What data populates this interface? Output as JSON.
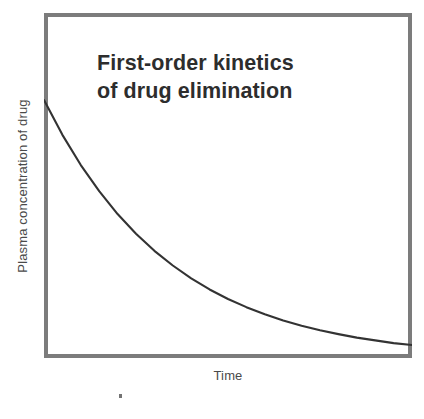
{
  "figure": {
    "width": 424,
    "height": 419,
    "background": "#ffffff"
  },
  "title_line_1": "First-order kinetics",
  "title_line_2": "of drug elimination",
  "title_full": "First-order kinetics\nof drug elimination",
  "axis": {
    "y_label": "Plasma concentration of drug",
    "x_label": "Time"
  },
  "colors": {
    "frame": "#7c7c7c",
    "curve": "#333333",
    "title_text": "#2d2d2d",
    "axis_text": "#4a4a4a",
    "plot_background": "#ffffff",
    "speck": "#5a5a5a"
  },
  "frame": {
    "left": 44,
    "top": 13,
    "width": 368,
    "height": 345,
    "border_width": 4
  },
  "chart_data": {
    "type": "line",
    "title": "First-order kinetics of drug elimination",
    "xlabel": "Time",
    "ylabel": "Plasma concentration of drug",
    "xlim": [
      0,
      1
    ],
    "ylim": [
      0,
      1
    ],
    "grid": false,
    "legend": null,
    "axis_ticks": {
      "x": [],
      "y": []
    },
    "curve_model": "exponential decay: y = y_inf + (y_0 - y_inf) * exp(-k * x)",
    "series": [
      {
        "name": "Plasma concentration",
        "color": "#333333",
        "line_width": 2,
        "x": [
          0.0,
          0.05,
          0.1,
          0.15,
          0.2,
          0.25,
          0.3,
          0.35,
          0.4,
          0.45,
          0.5,
          0.55,
          0.6,
          0.65,
          0.7,
          0.75,
          0.8,
          0.85,
          0.9,
          0.95,
          1.0
        ],
        "y": [
          1.0,
          0.872,
          0.761,
          0.665,
          0.581,
          0.509,
          0.446,
          0.392,
          0.345,
          0.304,
          0.269,
          0.239,
          0.213,
          0.19,
          0.171,
          0.154,
          0.14,
          0.127,
          0.117,
          0.107,
          0.1
        ]
      }
    ],
    "points_px": [
      {
        "x": 0,
        "y": 87
      },
      {
        "x": 37,
        "y": 132
      },
      {
        "x": 74,
        "y": 171
      },
      {
        "x": 110,
        "y": 205
      },
      {
        "x": 147,
        "y": 234
      },
      {
        "x": 184,
        "y": 260
      },
      {
        "x": 221,
        "y": 281
      },
      {
        "x": 258,
        "y": 299
      },
      {
        "x": 294,
        "y": 313
      },
      {
        "x": 331,
        "y": 324
      },
      {
        "x": 368,
        "y": 332
      }
    ]
  },
  "artifacts": {
    "speck": {
      "x": 119,
      "y": 394,
      "width": 3,
      "height": 4
    }
  }
}
